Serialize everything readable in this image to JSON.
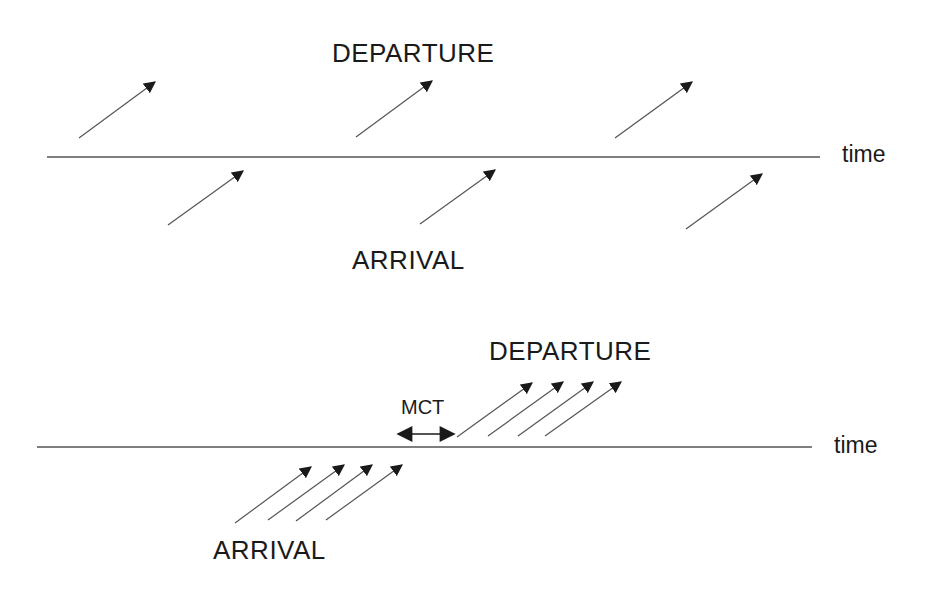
{
  "colors": {
    "line": "#555555",
    "arrow": "#1a1a1a",
    "text": "#1a1a1a",
    "background": "#ffffff"
  },
  "panels": [
    {
      "id": "top",
      "timeline": {
        "x1": 47,
        "x2": 820,
        "y": 157,
        "label": "time",
        "label_x": 842,
        "label_y": 143
      },
      "departure_label": {
        "text": "DEPARTURE",
        "x": 332,
        "y": 40
      },
      "arrival_label": {
        "text": "ARRIVAL",
        "x": 352,
        "y": 247
      },
      "departure_arrows": [
        {
          "x1": 79,
          "y1": 138,
          "x2": 155,
          "y2": 82
        },
        {
          "x1": 356,
          "y1": 137,
          "x2": 432,
          "y2": 81
        },
        {
          "x1": 615,
          "y1": 138,
          "x2": 692,
          "y2": 82
        }
      ],
      "arrival_arrows": [
        {
          "x1": 168,
          "y1": 225,
          "x2": 243,
          "y2": 171
        },
        {
          "x1": 420,
          "y1": 224,
          "x2": 495,
          "y2": 170
        },
        {
          "x1": 686,
          "y1": 229,
          "x2": 762,
          "y2": 174
        }
      ]
    },
    {
      "id": "bottom",
      "timeline": {
        "x1": 37,
        "x2": 812,
        "y": 447,
        "label": "time",
        "label_x": 834,
        "label_y": 434
      },
      "departure_label": {
        "text": "DEPARTURE",
        "x": 489,
        "y": 338
      },
      "arrival_label": {
        "text": "ARRIVAL",
        "x": 213,
        "y": 537
      },
      "mct": {
        "text": "MCT",
        "x": 401,
        "y": 397,
        "arrow_x1": 398,
        "arrow_x2": 454,
        "arrow_y": 434
      },
      "departure_arrows": [
        {
          "x1": 457,
          "y1": 437,
          "x2": 532,
          "y2": 383
        },
        {
          "x1": 488,
          "y1": 436,
          "x2": 563,
          "y2": 382
        },
        {
          "x1": 518,
          "y1": 436,
          "x2": 593,
          "y2": 382
        },
        {
          "x1": 545,
          "y1": 436,
          "x2": 621,
          "y2": 382
        }
      ],
      "arrival_arrows": [
        {
          "x1": 235,
          "y1": 523,
          "x2": 311,
          "y2": 467
        },
        {
          "x1": 268,
          "y1": 520,
          "x2": 344,
          "y2": 465
        },
        {
          "x1": 296,
          "y1": 521,
          "x2": 372,
          "y2": 465
        },
        {
          "x1": 326,
          "y1": 520,
          "x2": 402,
          "y2": 465
        }
      ]
    }
  ]
}
